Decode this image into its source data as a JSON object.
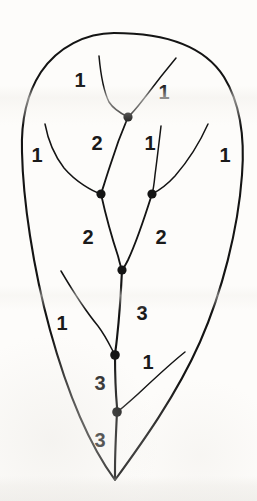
{
  "figure": {
    "type": "dendritic-stream-order-diagram",
    "width": 257,
    "height": 501,
    "background_color": "#fdfcfa",
    "ink_color": "#141414"
  },
  "basin_outline": {
    "name": "drainage-basin-boundary",
    "stroke_color": "#141414",
    "stroke_width": 2.1,
    "path": "M 114 33 C 86 33 58 47 41 72 C 26 95 21 124 22 152 C 23 200 33 268 50 330 C 66 388 88 443 115 480 C 142 443 176 396 200 342 C 222 292 238 230 242 175 C 245 137 240 103 224 77 C 205 47 166 33 114 33 Z"
  },
  "channels": [
    {
      "name": "channel-order1-top-left",
      "order": 1,
      "path": "M 99 56 C 101 78 104 92 109 102 C 114 110 122 114 128 117"
    },
    {
      "name": "channel-order1-top-right",
      "order": 1,
      "path": "M 176 58 C 166 70 155 84 146 96 C 139 105 133 113 128 117"
    },
    {
      "name": "channel-order2-left-upper",
      "order": 2,
      "path": "M 128 117 C 122 131 115 150 110 166 C 106 178 103 188 101 194"
    },
    {
      "name": "channel-order1-left-tributary",
      "order": 1,
      "path": "M 45 124 C 48 140 54 155 64 168 C 76 182 92 191 101 194"
    },
    {
      "name": "channel-order1-right-inner",
      "order": 1,
      "path": "M 161 126 C 159 143 157 160 155 175 C 154 185 153 191 152 194"
    },
    {
      "name": "channel-order1-right-outer",
      "order": 1,
      "path": "M 208 124 C 200 142 188 161 175 176 C 165 187 156 192 152 194"
    },
    {
      "name": "channel-order2-left-lower",
      "order": 2,
      "path": "M 101 194 C 105 212 112 238 118 256 C 120 264 121 268 122 270"
    },
    {
      "name": "channel-order2-right-lower",
      "order": 2,
      "path": "M 152 194 C 146 213 136 243 128 260 C 125 266 123 269 122 270"
    },
    {
      "name": "channel-order3-upper",
      "order": 3,
      "path": "M 122 270 C 121 292 119 320 117 338 C 116 348 115 353 115 355"
    },
    {
      "name": "channel-order1-lower-left-tributary",
      "order": 1,
      "path": "M 61 271 C 71 288 84 309 98 326 C 107 338 112 350 115 355"
    },
    {
      "name": "channel-order3-middle",
      "order": 3,
      "path": "M 115 355 C 115 374 116 396 117 407 C 117 410 117 411 117 412"
    },
    {
      "name": "channel-order1-lower-right-tributary",
      "order": 1,
      "path": "M 185 352 C 171 363 154 379 138 394 C 128 403 120 410 117 412"
    },
    {
      "name": "channel-order3-outlet",
      "order": 3,
      "path": "M 117 412 C 116 432 115 455 115 470 C 115 476 115 479 115 480"
    }
  ],
  "junction_nodes": [
    {
      "name": "junction-node-top",
      "cx": 128,
      "cy": 117,
      "r": 4.6
    },
    {
      "name": "junction-node-mid-left",
      "cx": 101,
      "cy": 194,
      "r": 4.6
    },
    {
      "name": "junction-node-mid-right",
      "cx": 152,
      "cy": 194,
      "r": 4.6
    },
    {
      "name": "junction-node-center",
      "cx": 122,
      "cy": 270,
      "r": 4.6
    },
    {
      "name": "junction-node-lower-upper",
      "cx": 115,
      "cy": 355,
      "r": 4.8
    },
    {
      "name": "junction-node-lower-bottom",
      "cx": 117,
      "cy": 412,
      "r": 4.8
    }
  ],
  "order_labels": [
    {
      "name": "order-label-1-top-left",
      "text": "1",
      "x": 80,
      "y": 80
    },
    {
      "name": "order-label-1-top-right",
      "text": "1",
      "x": 164,
      "y": 92
    },
    {
      "name": "order-label-2-upper-left",
      "text": "2",
      "x": 97,
      "y": 143
    },
    {
      "name": "order-label-1-inner-right",
      "text": "1",
      "x": 150,
      "y": 143
    },
    {
      "name": "order-label-1-far-left",
      "text": "1",
      "x": 37,
      "y": 155
    },
    {
      "name": "order-label-1-far-right",
      "text": "1",
      "x": 225,
      "y": 155
    },
    {
      "name": "order-label-2-lower-left",
      "text": "2",
      "x": 88,
      "y": 237
    },
    {
      "name": "order-label-2-lower-right",
      "text": "2",
      "x": 161,
      "y": 237
    },
    {
      "name": "order-label-3-upper",
      "text": "3",
      "x": 142,
      "y": 313
    },
    {
      "name": "order-label-1-mid-left",
      "text": "1",
      "x": 62,
      "y": 323
    },
    {
      "name": "order-label-1-mid-right",
      "text": "1",
      "x": 148,
      "y": 362
    },
    {
      "name": "order-label-3-middle",
      "text": "3",
      "x": 100,
      "y": 383
    },
    {
      "name": "order-label-3-outlet",
      "text": "3",
      "x": 100,
      "y": 440
    }
  ]
}
